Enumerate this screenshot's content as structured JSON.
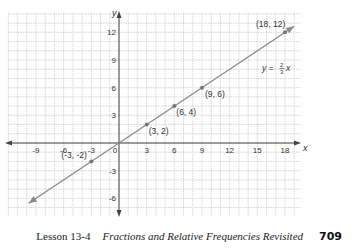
{
  "chart_data": {
    "type": "line",
    "title": "",
    "xlabel": "x",
    "ylabel": "y",
    "xlim": [
      -12,
      19.5
    ],
    "ylim": [
      -8,
      14
    ],
    "grid": true,
    "x_ticks": [
      -9,
      -6,
      -3,
      0,
      3,
      6,
      9,
      12,
      15,
      18
    ],
    "y_ticks": [
      12,
      9,
      6,
      3,
      -3,
      -6
    ],
    "series": [
      {
        "name": "y = 2/3 x",
        "equation": "y = (2/3)x",
        "line_extent": {
          "x": [
            -9.8,
            19
          ],
          "y": [
            -6.53,
            12.67
          ]
        },
        "points": [
          {
            "x": -3,
            "y": -2,
            "label": "(-3, -2)"
          },
          {
            "x": 3,
            "y": 2,
            "label": "(3, 2)"
          },
          {
            "x": 6,
            "y": 4,
            "label": "(6, 4)"
          },
          {
            "x": 9,
            "y": 6,
            "label": "(9, 6)"
          },
          {
            "x": 18,
            "y": 12,
            "label": "(18, 12)"
          }
        ]
      }
    ],
    "annotations": [
      {
        "text": "y = 2/3 x",
        "near": {
          "x": 17,
          "y": 8
        }
      }
    ]
  },
  "axes": {
    "x_label": "x",
    "y_label": "y"
  },
  "equation": {
    "lhs": "y =",
    "num": "2",
    "den": "3",
    "var": "x"
  },
  "footer": {
    "lesson": "Lesson 13-4",
    "title": "Fractions and Relative Frequencies Revisited",
    "page": "709"
  },
  "colors": {
    "grid": "#b8b8b8",
    "axis": "#444444",
    "line": "#8a8a8a",
    "point": "#777777"
  }
}
